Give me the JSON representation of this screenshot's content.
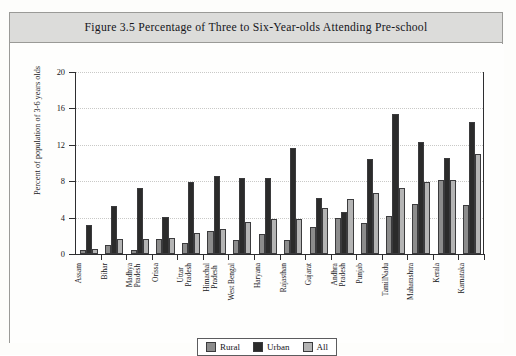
{
  "figure": {
    "title": "Figure 3.5 Percentage of Three to Six-Year-olds Attending Pre-school"
  },
  "legend": {
    "items": [
      {
        "label": "Rural",
        "color": "#8c8c8c"
      },
      {
        "label": "Urban",
        "color": "#2b2b2b"
      },
      {
        "label": "All",
        "color": "#b4b4b4"
      }
    ]
  },
  "chart_data": {
    "type": "bar",
    "title": "Figure 3.5 Percentage of Three to Six-Year-olds Attending Pre-school",
    "xlabel": "",
    "ylabel": "Percent of population of 3-6 years olds",
    "ylim": [
      0,
      20
    ],
    "yticks": [
      0,
      4,
      8,
      12,
      16,
      20
    ],
    "ytick_labels": [
      "0",
      "4",
      "8",
      "12",
      "16",
      "20"
    ],
    "grid": true,
    "legend_position": "bottom-center",
    "categories": [
      "Assam",
      "Bihar",
      "Madhya\nPradesh",
      "Orissa",
      "Uttar\nPradesh",
      "Himachal\nPradesh",
      "West Bengal",
      "Haryana",
      "Rajasthan",
      "Gujarat",
      "Andhra\nPradesh",
      "Punjab",
      "TamilNadu",
      "Maharashtra",
      "Kerala",
      "Karnataka"
    ],
    "series": [
      {
        "name": "Rural",
        "color": "#8c8c8c",
        "values": [
          0.4,
          1.0,
          0.4,
          1.7,
          1.2,
          2.5,
          1.5,
          2.2,
          1.5,
          3.0,
          4.0,
          3.4,
          4.2,
          5.5,
          8.1,
          5.4
        ]
      },
      {
        "name": "Urban",
        "color": "#2b2b2b",
        "values": [
          3.2,
          5.3,
          7.3,
          4.1,
          7.9,
          8.6,
          8.3,
          8.3,
          11.7,
          6.2,
          4.6,
          10.4,
          15.4,
          12.3,
          10.5,
          14.5
        ]
      },
      {
        "name": "All",
        "color": "#b4b4b4",
        "values": [
          0.6,
          1.7,
          1.6,
          1.8,
          2.3,
          2.8,
          3.5,
          3.9,
          3.9,
          5.1,
          6.0,
          6.7,
          7.3,
          7.9,
          8.1,
          11.0
        ]
      }
    ]
  }
}
